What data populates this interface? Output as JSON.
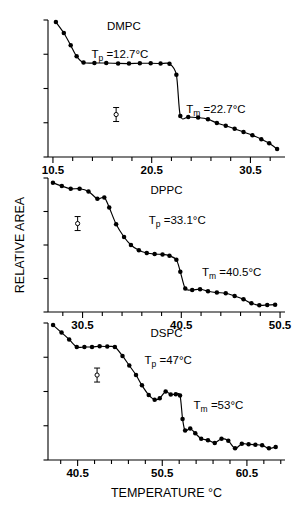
{
  "figure": {
    "xlabel": "TEMPERATURE °C",
    "ylabel": "RELATIVE AREA",
    "background": "#ffffff",
    "ink": "#000000"
  },
  "chart_data": [
    {
      "type": "scatter",
      "panel": 1,
      "title": "DMPC",
      "sample_label": "DMPC",
      "xlabel": "",
      "ylabel": "RELATIVE AREA",
      "xlim": [
        10.0,
        34.0
      ],
      "ylim": [
        0.0,
        1.0
      ],
      "xticks": [
        10.5,
        20.5,
        30.5
      ],
      "xtick_labels": [
        "10.5",
        "20.5",
        "30.5"
      ],
      "minor_xtick_step": 2,
      "n_yticks": 5,
      "grid": false,
      "legend": "none",
      "annotations": [
        {
          "name": "pretransition",
          "text": "T_p =12.7°C",
          "symbol": "T",
          "sub": "p",
          "value": "12.7",
          "unit": "°C",
          "x": 14.4,
          "y": 0.72
        },
        {
          "name": "main-transition",
          "text": "T_m =22.7°C",
          "symbol": "T",
          "sub": "m",
          "value": "22.7",
          "unit": "°C",
          "x": 24.0,
          "y": 0.32
        },
        {
          "name": "error-bar",
          "text": "",
          "x": 16.9,
          "y": 0.31
        }
      ],
      "x": [
        10.8,
        11.6,
        12.3,
        12.9,
        13.6,
        14.7,
        15.9,
        17.1,
        18.2,
        19.3,
        20.4,
        21.4,
        22.3,
        23.0,
        23.4,
        24.2,
        25.2,
        26.2,
        27.1,
        28.0,
        28.9,
        29.8,
        30.7,
        31.6,
        32.4,
        33.2
      ],
      "y": [
        0.985,
        0.905,
        0.815,
        0.735,
        0.69,
        0.686,
        0.686,
        0.683,
        0.682,
        0.684,
        0.684,
        0.682,
        0.68,
        0.6,
        0.3,
        0.292,
        0.288,
        0.276,
        0.248,
        0.228,
        0.206,
        0.182,
        0.158,
        0.13,
        0.1,
        0.058
      ]
    },
    {
      "type": "scatter",
      "panel": 2,
      "title": "DPPC",
      "sample_label": "DPPC",
      "xlabel": "",
      "ylabel": "RELATIVE AREA",
      "xlim": [
        27.0,
        51.0
      ],
      "ylim": [
        0.0,
        1.0
      ],
      "xticks": [
        30.5,
        40.5,
        50.5
      ],
      "xtick_labels": [
        "30.5",
        "40.5",
        "50.5"
      ],
      "minor_xtick_step": 2,
      "n_yticks": 5,
      "grid": false,
      "legend": "none",
      "annotations": [
        {
          "name": "pretransition",
          "text": "T_p =33.1°C",
          "symbol": "T",
          "sub": "p",
          "value": "33.1",
          "unit": "°C",
          "x": 37.2,
          "y": 0.66
        },
        {
          "name": "main-transition",
          "text": "T_m =40.5°C",
          "symbol": "T",
          "sub": "m",
          "value": "40.5",
          "unit": "°C",
          "x": 42.6,
          "y": 0.27
        },
        {
          "name": "error-bar",
          "text": "",
          "x": 30.0,
          "y": 0.66
        }
      ],
      "x": [
        27.5,
        28.4,
        29.3,
        30.2,
        31.1,
        32.0,
        32.7,
        33.2,
        33.9,
        34.7,
        35.4,
        36.2,
        37.0,
        37.8,
        38.6,
        39.3,
        40.0,
        40.4,
        40.9,
        41.6,
        42.4,
        43.2,
        44.1,
        45.0,
        45.9,
        46.8,
        47.6,
        48.4,
        49.2,
        50.0
      ],
      "y": [
        0.965,
        0.94,
        0.92,
        0.92,
        0.9,
        0.845,
        0.855,
        0.78,
        0.655,
        0.56,
        0.5,
        0.46,
        0.44,
        0.432,
        0.43,
        0.42,
        0.39,
        0.3,
        0.175,
        0.165,
        0.17,
        0.155,
        0.145,
        0.14,
        0.12,
        0.095,
        0.065,
        0.05,
        0.052,
        0.055
      ]
    },
    {
      "type": "scatter",
      "panel": 3,
      "title": "DSPC",
      "sample_label": "DSPC",
      "xlabel": "TEMPERATURE °C",
      "ylabel": "RELATIVE AREA",
      "xlim": [
        37.0,
        65.0
      ],
      "ylim": [
        0.0,
        1.0
      ],
      "xticks": [
        40.5,
        50.5,
        60.5
      ],
      "xtick_labels": [
        "40.5",
        "50.5",
        "60.5"
      ],
      "minor_xtick_step": 2,
      "n_yticks": 5,
      "grid": false,
      "legend": "none",
      "annotations": [
        {
          "name": "pretransition",
          "text": "T_p =47°C",
          "symbol": "T",
          "sub": "p",
          "value": "47",
          "unit": "°C",
          "x": 48.4,
          "y": 0.7
        },
        {
          "name": "main-transition",
          "text": "T_m =53°C",
          "symbol": "T",
          "sub": "m",
          "value": "53",
          "unit": "°C",
          "x": 54.2,
          "y": 0.37
        },
        {
          "name": "error-bar",
          "text": "",
          "x": 42.8,
          "y": 0.62
        }
      ],
      "x": [
        37.6,
        38.6,
        39.5,
        40.4,
        41.3,
        42.2,
        43.1,
        44.0,
        44.9,
        45.8,
        46.6,
        47.4,
        48.1,
        48.9,
        49.6,
        50.2,
        50.9,
        51.5,
        52.1,
        52.6,
        52.9,
        53.2,
        53.8,
        54.4,
        55.1,
        55.9,
        56.7,
        57.5,
        58.3,
        59.1,
        59.9,
        60.7,
        61.5,
        62.3,
        63.1,
        63.9
      ],
      "y": [
        0.985,
        0.93,
        0.88,
        0.825,
        0.825,
        0.825,
        0.83,
        0.828,
        0.825,
        0.76,
        0.69,
        0.62,
        0.545,
        0.475,
        0.44,
        0.45,
        0.5,
        0.478,
        0.48,
        0.47,
        0.3,
        0.215,
        0.23,
        0.195,
        0.155,
        0.145,
        0.125,
        0.155,
        0.14,
        0.085,
        0.118,
        0.115,
        0.112,
        0.108,
        0.085,
        0.095
      ]
    }
  ]
}
